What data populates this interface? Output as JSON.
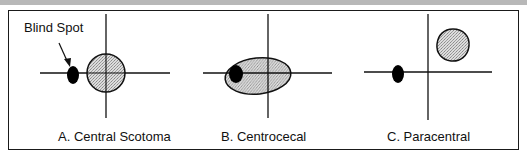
{
  "figure": {
    "annotation": "Blind Spot",
    "panels": [
      {
        "id": "A",
        "caption": "A. Central Scotoma"
      },
      {
        "id": "B",
        "caption": "B. Centrocecal"
      },
      {
        "id": "C",
        "caption": "C. Paracentral"
      }
    ]
  },
  "colors": {
    "line": "#111111",
    "scotoma_fill": "#c8c8c8",
    "blind_spot": "#000000"
  }
}
